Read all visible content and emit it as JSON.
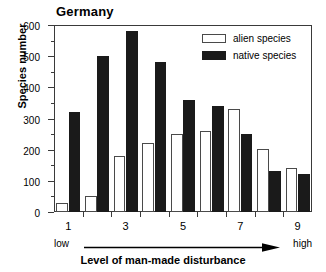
{
  "chart_data": {
    "type": "bar",
    "title": "Germany",
    "xlabel": "Level of man-made disturbance",
    "ylabel": "Species number",
    "categories": [
      "1",
      "2",
      "3",
      "4",
      "5",
      "6",
      "7",
      "8",
      "9"
    ],
    "x_tick_labels": [
      "1",
      "3",
      "5",
      "7",
      "9"
    ],
    "x_tick_values": [
      1,
      3,
      5,
      7,
      9
    ],
    "y_tick_labels": [
      "0",
      "100",
      "200",
      "300",
      "400",
      "500",
      "600"
    ],
    "y_tick_values": [
      0,
      100,
      200,
      300,
      400,
      500,
      600
    ],
    "y_minor_tick_values": [
      50,
      150,
      250,
      350,
      450,
      550
    ],
    "ylim": [
      0,
      600
    ],
    "grid": false,
    "legend_position": "top-right",
    "series": [
      {
        "name": "alien species",
        "color": "#ffffff",
        "edge_color": "#4a4a4a",
        "values": [
          30,
          50,
          180,
          220,
          250,
          260,
          330,
          202,
          142
        ]
      },
      {
        "name": "native species",
        "color": "#1a1a1a",
        "edge_color": "#1a1a1a",
        "values": [
          320,
          500,
          580,
          480,
          360,
          340,
          250,
          132,
          122
        ]
      }
    ],
    "annotations": {
      "scale_low": "low",
      "scale_high": "high",
      "scale_arrow": "right-arrow"
    }
  }
}
